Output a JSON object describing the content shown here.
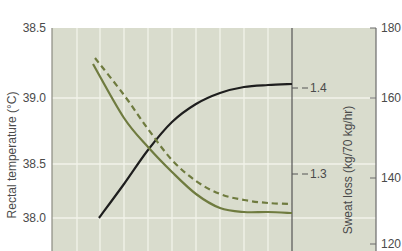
{
  "chart_data": {
    "type": "line",
    "title": "",
    "xlabel": "",
    "colors": {
      "background": "#d9dccd",
      "grid": "#f2f3ea",
      "axis": "#6b6b6b",
      "olive": "#6f7b3f",
      "black": "#1e1e1e",
      "text": "#4a4a4a"
    },
    "axes": {
      "left": {
        "label": "Rectal temperature (°C)",
        "ticks": [
          {
            "label": "38.5",
            "y": 28
          },
          {
            "label": "39.0",
            "y": 98
          },
          {
            "label": "38.5",
            "y": 164
          },
          {
            "label": "38.0",
            "y": 218
          }
        ]
      },
      "middle": {
        "label": "Sweat loss (kg/70 kg/hr)",
        "ticks": [
          {
            "label": "1.4",
            "y": 88
          },
          {
            "label": "1.3",
            "y": 174
          }
        ]
      },
      "right": {
        "label": "",
        "ticks": [
          {
            "label": "180",
            "y": 28
          },
          {
            "label": "160",
            "y": 98
          },
          {
            "label": "140",
            "y": 178
          },
          {
            "label": "120",
            "y": 244
          }
        ]
      }
    },
    "grid": {
      "vertical_x": [
        77,
        100,
        124,
        148,
        172,
        196,
        220,
        244,
        268
      ],
      "horizontal_y": [
        98,
        164,
        218
      ]
    },
    "series": [
      {
        "name": "Sweat loss",
        "axis": "middle",
        "style": "solid",
        "color": "black",
        "points": [
          [
            99,
            218
          ],
          [
            124,
            184
          ],
          [
            148,
            150
          ],
          [
            172,
            122
          ],
          [
            196,
            104
          ],
          [
            220,
            93
          ],
          [
            244,
            87
          ],
          [
            268,
            85
          ],
          [
            292,
            84
          ]
        ],
        "approx_values": [
          1.28,
          1.32,
          1.35,
          1.37,
          1.38,
          1.39,
          1.4,
          1.4,
          1.4
        ]
      },
      {
        "name": "Rectal temperature (dashed)",
        "axis": "left",
        "style": "dashed",
        "color": "olive",
        "points": [
          [
            95,
            58
          ],
          [
            124,
            95
          ],
          [
            148,
            129
          ],
          [
            172,
            160
          ],
          [
            196,
            181
          ],
          [
            220,
            194
          ],
          [
            244,
            200
          ],
          [
            268,
            203
          ],
          [
            292,
            204
          ]
        ]
      },
      {
        "name": "Rectal temperature (solid)",
        "axis": "left",
        "style": "solid",
        "color": "olive",
        "points": [
          [
            93,
            64
          ],
          [
            124,
            118
          ],
          [
            148,
            147
          ],
          [
            172,
            172
          ],
          [
            196,
            194
          ],
          [
            220,
            208
          ],
          [
            244,
            212
          ],
          [
            268,
            212
          ],
          [
            292,
            213
          ]
        ]
      }
    ]
  }
}
